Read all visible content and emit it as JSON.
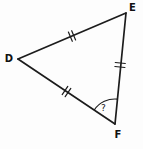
{
  "diagram": {
    "type": "geometry-triangle",
    "background_color": "#fdfdfd",
    "line_color": "#1c1c1c",
    "triangle": {
      "vertices": [
        {
          "label": "D",
          "position": "left"
        },
        {
          "label": "E",
          "position": "top-right"
        },
        {
          "label": "F",
          "position": "bottom-right"
        }
      ],
      "sides": [
        {
          "from": "D",
          "to": "E",
          "tick_marks": "double",
          "congruent": true
        },
        {
          "from": "E",
          "to": "F",
          "tick_marks": "double",
          "congruent": true
        },
        {
          "from": "D",
          "to": "F",
          "tick_marks": "double",
          "congruent": true
        }
      ],
      "angle": {
        "vertex": "F",
        "label": "?",
        "marker": "arc"
      }
    }
  }
}
